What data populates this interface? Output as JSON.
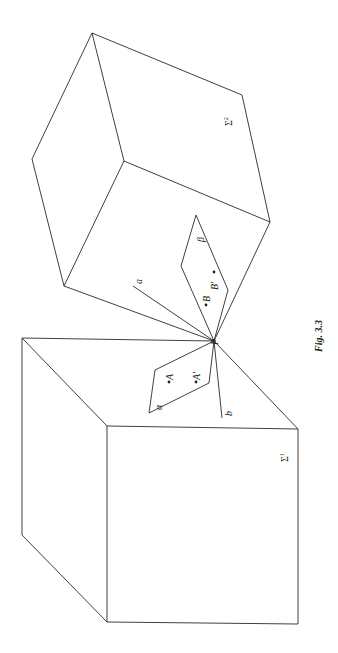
{
  "figure": {
    "caption": "Fig. 3.3",
    "labels": {
      "sigma1": "Σ",
      "sigma1_sub": "1",
      "sigma2": "Σ",
      "sigma2_sub": "2",
      "point_P": "P",
      "line_a": "a",
      "line_b": "b",
      "plane_alpha": "α",
      "plane_beta": "β",
      "point_A": "A",
      "point_A_prime": "A′",
      "point_B": "B",
      "point_B_prime": "B′"
    },
    "stroke_color": "#2a2a2a",
    "background": "#ffffff"
  }
}
